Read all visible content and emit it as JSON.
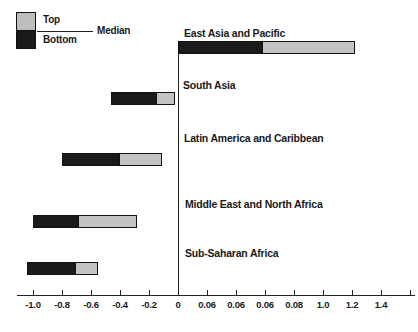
{
  "chart_data": {
    "type": "bar",
    "orientation": "horizontal",
    "legend": {
      "top": "Top",
      "bottom": "Bottom",
      "median": "Median",
      "position": "top-left"
    },
    "x_axis": {
      "range": [
        -1.1,
        1.65
      ],
      "grid": false,
      "ticks": [
        {
          "label": "-1.0",
          "v": -1.0
        },
        {
          "label": "-0.8",
          "v": -0.8
        },
        {
          "label": "-0.6",
          "v": -0.6
        },
        {
          "label": "-0.4",
          "v": -0.4
        },
        {
          "label": "-0.2",
          "v": -0.2
        },
        {
          "label": "0",
          "v": 0.0,
          "bold": true
        },
        {
          "label": "0.06",
          "v": 0.2
        },
        {
          "label": "0.06",
          "v": 0.4
        },
        {
          "label": "0.06",
          "v": 0.6
        },
        {
          "label": "0.08",
          "v": 0.8
        },
        {
          "label": "1.0",
          "v": 1.0
        },
        {
          "label": "1.2",
          "v": 1.2
        },
        {
          "label": "1.4",
          "v": 1.4
        },
        {
          "label": "",
          "v": 1.6
        }
      ]
    },
    "bars": [
      {
        "category": "East Asia and Pacific",
        "from": 0.0,
        "median": 0.58,
        "to": 1.22
      },
      {
        "category": "South Asia",
        "from": -0.46,
        "median": -0.15,
        "to": -0.02
      },
      {
        "category": "Latin America and Caribbean",
        "from": -0.8,
        "median": -0.41,
        "to": -0.11
      },
      {
        "category": "Middle East and North Africa",
        "from": -1.0,
        "median": -0.69,
        "to": -0.28
      },
      {
        "category": "Sub-Saharan Africa",
        "from": -1.04,
        "median": -0.71,
        "to": -0.55
      }
    ],
    "colors": {
      "bottom_segment": "#1a1a1a",
      "top_segment": "#c3c3c3",
      "legend_top_swatch": "#bdbdbd",
      "outline": "#111111",
      "axis": "#222222",
      "text": "#1a1a1a",
      "background": "#ffffff"
    }
  }
}
